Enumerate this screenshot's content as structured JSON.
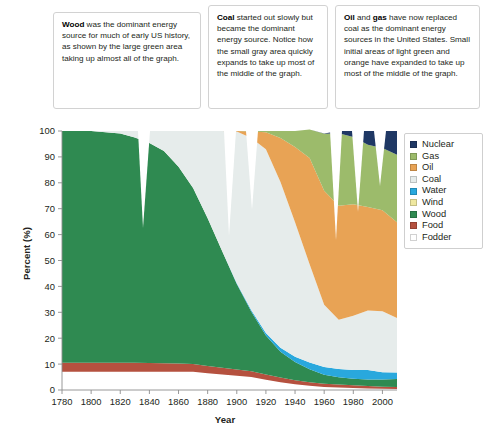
{
  "callouts": [
    {
      "id": "wood",
      "keyword": "Wood",
      "text": " was the dominant energy source for much of early US history, as shown by the large green area taking up almost all of the graph."
    },
    {
      "id": "coal",
      "keyword": "Coal",
      "text": " started out slowly but became the dominant energy source. Notice how the small gray area quickly expands to take up most of the middle of the graph."
    },
    {
      "id": "oil",
      "keyword": "Oil",
      "keyword2": "gas",
      "text_mid": " and ",
      "text": " have now replaced coal as the dominant energy sources in the United States. Small initial areas of light green and orange have expanded to take up most of the middle of the graph."
    }
  ],
  "legend": {
    "items": [
      {
        "label": "Nuclear",
        "color": "#1f3864"
      },
      {
        "label": "Gas",
        "color": "#9cbb6b"
      },
      {
        "label": "Oil",
        "color": "#e8a355"
      },
      {
        "label": "Coal",
        "color": "#e6eceb"
      },
      {
        "label": "Water",
        "color": "#29a8dd"
      },
      {
        "label": "Wind",
        "color": "#efe8a0"
      },
      {
        "label": "Wood",
        "color": "#2f8a51"
      },
      {
        "label": "Food",
        "color": "#b5513f"
      },
      {
        "label": "Fodder",
        "color": "#ffffff"
      }
    ]
  },
  "chart_data": {
    "type": "area",
    "title": "",
    "xlabel": "Year",
    "ylabel": "Percent (%)",
    "xlim": [
      1780,
      2010
    ],
    "ylim": [
      0,
      100
    ],
    "grid": false,
    "legend_position": "right",
    "xticks": [
      1780,
      1800,
      1820,
      1840,
      1860,
      1880,
      1900,
      1920,
      1940,
      1960,
      1980,
      2000
    ],
    "yticks": [
      0,
      10,
      20,
      30,
      40,
      50,
      60,
      70,
      80,
      90,
      100
    ],
    "stack_order_bottom_to_top": [
      "Fodder",
      "Food",
      "Wood",
      "Water",
      "Coal",
      "Oil",
      "Gas",
      "Nuclear"
    ],
    "x": [
      1780,
      1790,
      1800,
      1810,
      1820,
      1830,
      1840,
      1850,
      1860,
      1870,
      1880,
      1890,
      1900,
      1910,
      1920,
      1930,
      1940,
      1950,
      1960,
      1970,
      1980,
      1990,
      2000,
      2010
    ],
    "series": [
      {
        "name": "Fodder",
        "color": "#ffffff",
        "values": [
          7,
          7,
          7,
          7,
          7,
          7,
          7,
          7,
          7,
          7,
          6.5,
          6,
          5.5,
          5,
          4,
          3,
          2.2,
          1.6,
          1.2,
          1,
          0.8,
          0.6,
          0.5,
          0.4
        ]
      },
      {
        "name": "Food",
        "color": "#b5513f",
        "values": [
          3.5,
          3.5,
          3.5,
          3.5,
          3.5,
          3.5,
          3.4,
          3.3,
          3.2,
          3,
          2.8,
          2.6,
          2.4,
          2.2,
          2,
          1.8,
          1.6,
          1.4,
          1.2,
          1.1,
          1,
          0.9,
          0.8,
          0.8
        ]
      },
      {
        "name": "Wood",
        "color": "#2f8a51",
        "values": [
          89.5,
          89.5,
          89.5,
          89,
          88.5,
          87,
          85,
          82,
          76,
          68,
          57,
          45,
          33,
          23,
          15,
          10,
          7,
          5,
          3.5,
          2.8,
          2.5,
          2.6,
          2.8,
          3
        ]
      },
      {
        "name": "Water",
        "color": "#29a8dd",
        "values": [
          0,
          0,
          0,
          0,
          0,
          0,
          0,
          0,
          0,
          0,
          0,
          0,
          0.3,
          0.6,
          1,
          1.5,
          2,
          2.6,
          3,
          3.2,
          3.4,
          3.6,
          2.8,
          2.6
        ]
      },
      {
        "name": "Coal",
        "color": "#e6eceb",
        "values": [
          0,
          0,
          0,
          0.5,
          1,
          2.5,
          4.6,
          7.7,
          13.8,
          22,
          33.7,
          46.4,
          58.6,
          66.5,
          71,
          64,
          52,
          38,
          24,
          19,
          21,
          23,
          23.5,
          21
        ]
      },
      {
        "name": "Oil",
        "color": "#e8a355",
        "values": [
          0,
          0,
          0,
          0,
          0,
          0,
          0,
          0,
          0,
          0,
          0,
          0,
          0.2,
          2.5,
          6.5,
          17,
          29,
          41,
          44,
          44,
          43,
          40,
          39,
          37
        ]
      },
      {
        "name": "Gas",
        "color": "#9cbb6b",
        "values": [
          0,
          0,
          0,
          0,
          0,
          0,
          0,
          0,
          0,
          0,
          0,
          0,
          0,
          0.2,
          0.5,
          2.7,
          6.2,
          11,
          22,
          28,
          26,
          24,
          24,
          26
        ]
      },
      {
        "name": "Nuclear",
        "color": "#1f3864",
        "values": [
          0,
          0,
          0,
          0,
          0,
          0,
          0,
          0,
          0,
          0,
          0,
          0,
          0,
          0,
          0,
          0,
          0,
          0,
          0.1,
          0.9,
          2.3,
          5.3,
          6.6,
          9.2
        ]
      }
    ]
  }
}
